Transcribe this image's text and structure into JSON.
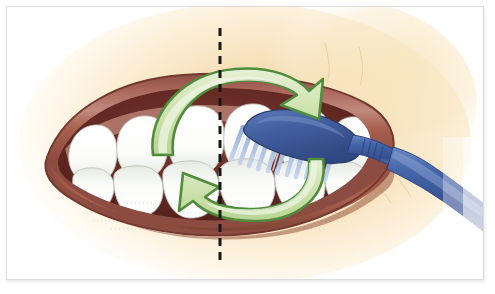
{
  "figure": {
    "border_color": "#dcdcdc",
    "background_color": "#ffffff"
  },
  "canvas": {
    "width": 495,
    "height": 294,
    "art_left": 7,
    "art_top": 7,
    "art_width": 476,
    "art_height": 272
  },
  "palette": {
    "skin_light": "#fdf3e2",
    "skin_mid": "#f6dfb4",
    "skin_deep": "#edcb92",
    "lip_outer": "#9d5a4e",
    "lip_mid": "#a8604f",
    "lip_dark": "#7d4037",
    "lip_highlight": "#c99183",
    "mouth_interior": "#6e332c",
    "mouth_interior_dark": "#52231e",
    "tooth_white": "#ffffff",
    "tooth_shade": "#e4e6e2",
    "tooth_outline": "#b9bdb4",
    "gum_pink": "#c07f72",
    "arrow_fill": "#cfe3b0",
    "arrow_fill_light": "#e2eecd",
    "arrow_stroke": "#4f8c3b",
    "brush_handle": "#3f5fa4",
    "brush_handle_dark": "#2e4680",
    "brush_handle_light": "#6782bd",
    "brush_head": "#43609f",
    "bristle_blue": "#7d9ad0",
    "bristle_pale": "#cdd9ef",
    "dash_line": "#171717",
    "border": "#dcdcdc"
  },
  "elements": {
    "midline": {
      "name": "vertical dashed midline",
      "label": "midline-dashed-guide",
      "x": 220,
      "y_top": 28,
      "y_bottom": 262,
      "dash_length": 8,
      "dash_gap": 6,
      "stroke_width": 3,
      "color": "#171717"
    },
    "arrow_top": {
      "name": "upper curved arrow",
      "label": "arrow-clockwise-upper",
      "direction": "clockwise-right",
      "points_to": "upper-right",
      "fill": "#cfe3b0",
      "stroke": "#4f8c3b"
    },
    "arrow_bottom": {
      "name": "lower curved arrow",
      "label": "arrow-clockwise-lower",
      "direction": "clockwise-left",
      "points_to": "left",
      "fill": "#cfe3b0",
      "stroke": "#4f8c3b"
    },
    "toothbrush": {
      "name": "toothbrush",
      "head_shape": "oval",
      "head_color": "#43609f",
      "handle_color": "#3f5fa4",
      "bristle_color": "#7d9ad0",
      "bristle_count": 11,
      "orientation": "entering from right, angled down-left"
    },
    "teeth": {
      "upper_count": 7,
      "lower_count": 7,
      "color": "#ffffff"
    },
    "mouth": {
      "lip_color": "#a8604f",
      "interior_color": "#6e332c"
    }
  },
  "annotations": {
    "caption": "",
    "labels": []
  }
}
